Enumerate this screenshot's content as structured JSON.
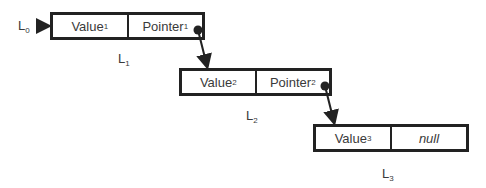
{
  "head": {
    "label": "L",
    "sub": "0"
  },
  "nodes": [
    {
      "name": "L",
      "name_sub": "1",
      "value": "Value",
      "value_sub": "1",
      "pointer": "Pointer",
      "pointer_sub": "1"
    },
    {
      "name": "L",
      "name_sub": "2",
      "value": "Value",
      "value_sub": "2",
      "pointer": "Pointer",
      "pointer_sub": "2"
    },
    {
      "name": "L",
      "name_sub": "3",
      "value": "Value",
      "value_sub": "3",
      "pointer": "null"
    }
  ],
  "colors": {
    "stroke": "#222222",
    "text": "#3a3a3a",
    "background": "#ffffff"
  }
}
